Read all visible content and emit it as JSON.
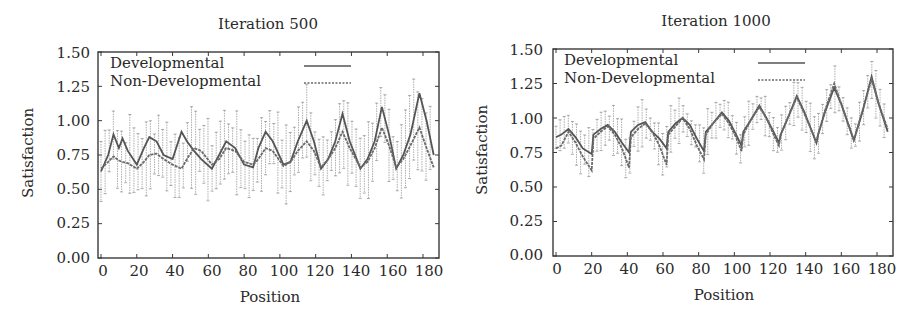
{
  "chart_data": [
    {
      "type": "line",
      "title": "Iteration 500",
      "xlabel": "Position",
      "ylabel": "Satisfaction",
      "xlim": [
        0,
        186
      ],
      "ylim": [
        0,
        1.5
      ],
      "x_ticks": [
        "0",
        "20",
        "40",
        "60",
        "80",
        "100",
        "120",
        "140",
        "160",
        "180"
      ],
      "y_ticks": [
        "0.00",
        "0.25",
        "0.50",
        "0.75",
        "1.00",
        "1.25",
        "1.50"
      ],
      "grid": false,
      "error_bars": true,
      "legend_position": "top-left inside",
      "x": [
        0,
        4,
        7,
        10,
        12,
        15,
        20,
        24,
        27,
        31,
        35,
        40,
        45,
        48,
        52,
        56,
        62,
        66,
        70,
        75,
        80,
        85,
        88,
        92,
        96,
        102,
        106,
        110,
        115,
        119,
        123,
        127,
        131,
        135,
        139,
        145,
        149,
        153,
        157,
        161,
        165,
        169,
        173,
        178,
        182,
        186
      ],
      "series": [
        {
          "name": "Developmental",
          "style": "solid",
          "values": [
            0.63,
            0.75,
            0.9,
            0.8,
            0.87,
            0.78,
            0.68,
            0.8,
            0.88,
            0.85,
            0.75,
            0.72,
            0.92,
            0.85,
            0.78,
            0.72,
            0.65,
            0.75,
            0.85,
            0.8,
            0.68,
            0.66,
            0.8,
            0.92,
            0.85,
            0.68,
            0.7,
            0.85,
            1.0,
            0.85,
            0.65,
            0.72,
            0.85,
            1.05,
            0.85,
            0.65,
            0.72,
            0.85,
            1.1,
            0.9,
            0.65,
            0.75,
            0.9,
            1.2,
            1.0,
            0.75
          ]
        },
        {
          "name": "Non-Developmental",
          "style": "dashed",
          "values": [
            0.65,
            0.7,
            0.74,
            0.71,
            0.7,
            0.69,
            0.65,
            0.7,
            0.75,
            0.76,
            0.72,
            0.68,
            0.65,
            0.72,
            0.8,
            0.78,
            0.68,
            0.72,
            0.8,
            0.78,
            0.7,
            0.68,
            0.72,
            0.8,
            0.78,
            0.67,
            0.7,
            0.78,
            0.85,
            0.78,
            0.66,
            0.72,
            0.8,
            0.92,
            0.8,
            0.66,
            0.7,
            0.8,
            0.95,
            0.82,
            0.66,
            0.72,
            0.82,
            0.95,
            0.8,
            0.66
          ]
        }
      ]
    },
    {
      "type": "line",
      "title": "Iteration 1000",
      "xlabel": "Position",
      "ylabel": "Satisfaction",
      "xlim": [
        0,
        186
      ],
      "ylim": [
        0,
        1.5
      ],
      "x_ticks": [
        "0",
        "20",
        "40",
        "60",
        "80",
        "100",
        "120",
        "140",
        "160",
        "180"
      ],
      "y_ticks": [
        "0.00",
        "0.25",
        "0.50",
        "0.75",
        "1.00",
        "1.25",
        "1.50"
      ],
      "grid": false,
      "error_bars": true,
      "legend_position": "top-left inside",
      "x": [
        0,
        3,
        7,
        11,
        15,
        20,
        21,
        25,
        29,
        33,
        37,
        41,
        42,
        46,
        50,
        54,
        58,
        62,
        63,
        67,
        71,
        75,
        79,
        83,
        84,
        88,
        93,
        97,
        101,
        104,
        105,
        109,
        114,
        118,
        122,
        125,
        126,
        130,
        135,
        139,
        143,
        146,
        147,
        151,
        156,
        160,
        164,
        167,
        168,
        172,
        177,
        181,
        186
      ],
      "series": [
        {
          "name": "Developmental",
          "style": "solid",
          "values": [
            0.86,
            0.88,
            0.92,
            0.86,
            0.78,
            0.74,
            0.88,
            0.92,
            0.95,
            0.9,
            0.82,
            0.75,
            0.9,
            0.95,
            0.97,
            0.9,
            0.85,
            0.78,
            0.9,
            0.96,
            1.0,
            0.95,
            0.85,
            0.76,
            0.9,
            0.96,
            1.04,
            0.98,
            0.88,
            0.8,
            0.9,
            0.98,
            1.09,
            1.0,
            0.9,
            0.82,
            0.88,
            1.0,
            1.16,
            1.05,
            0.92,
            0.82,
            0.88,
            1.05,
            1.22,
            1.1,
            0.95,
            0.84,
            0.88,
            1.05,
            1.3,
            1.1,
            0.9
          ]
        },
        {
          "name": "Non-Developmental",
          "style": "dashed",
          "values": [
            0.78,
            0.8,
            0.9,
            0.82,
            0.72,
            0.62,
            0.85,
            0.9,
            0.94,
            0.88,
            0.78,
            0.64,
            0.86,
            0.92,
            0.96,
            0.9,
            0.8,
            0.66,
            0.88,
            0.94,
            1.0,
            0.92,
            0.8,
            0.7,
            0.88,
            0.96,
            1.03,
            0.96,
            0.86,
            0.76,
            0.88,
            0.98,
            1.08,
            1.0,
            0.88,
            0.8,
            0.88,
            1.0,
            1.15,
            1.04,
            0.92,
            0.82,
            0.88,
            1.06,
            1.25,
            1.1,
            0.95,
            0.84,
            0.88,
            1.06,
            1.28,
            1.1,
            0.92
          ]
        }
      ]
    }
  ],
  "charts": [
    {
      "title": "Iteration 500",
      "xlabel": "Position",
      "ylabel": "Satisfaction",
      "legend": [
        "Developmental",
        "Non-Developmental"
      ],
      "x_ticks": [
        "0",
        "20",
        "40",
        "60",
        "80",
        "100",
        "120",
        "140",
        "160",
        "180"
      ],
      "y_ticks": [
        "0.00",
        "0.25",
        "0.50",
        "0.75",
        "1.00",
        "1.25",
        "1.50"
      ]
    },
    {
      "title": "Iteration 1000",
      "xlabel": "Position",
      "ylabel": "Satisfaction",
      "legend": [
        "Developmental",
        "Non-Developmental"
      ],
      "x_ticks": [
        "0",
        "20",
        "40",
        "60",
        "80",
        "100",
        "120",
        "140",
        "160",
        "180"
      ],
      "y_ticks": [
        "0.00",
        "0.25",
        "0.50",
        "0.75",
        "1.00",
        "1.25",
        "1.50"
      ]
    }
  ],
  "colors": {
    "axis": "#3a3a3a",
    "developmental": "#555555",
    "non_developmental": "#6a6a6a",
    "error_bar": "#8a8a8a"
  }
}
